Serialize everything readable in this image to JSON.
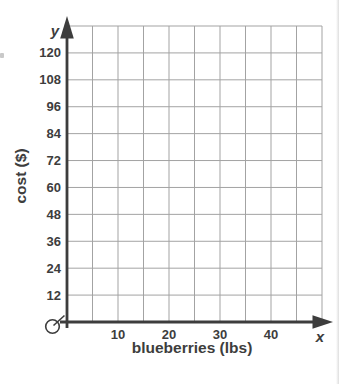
{
  "chart_data": {
    "type": "scatter",
    "title": "",
    "xlabel": "blueberries (lbs)",
    "ylabel": "cost ($)",
    "x_axis_letter": "x",
    "y_axis_letter": "y",
    "xlim": [
      0,
      50
    ],
    "ylim": [
      0,
      132
    ],
    "x_tick_step": 5,
    "y_tick_step": 12,
    "x_tick_labels": [
      10,
      20,
      30,
      40
    ],
    "y_tick_labels": [
      12,
      24,
      36,
      48,
      60,
      72,
      84,
      96,
      108,
      120
    ],
    "grid": true,
    "legend": "none",
    "series": []
  },
  "icons": {
    "origin_mark": "clock-zero-icon"
  },
  "colors": {
    "background": "#ffffff",
    "grid": "#a3a3a3",
    "axis": "#3d3d3d",
    "text": "#3d3d3d",
    "page_edge": "#dedede"
  }
}
